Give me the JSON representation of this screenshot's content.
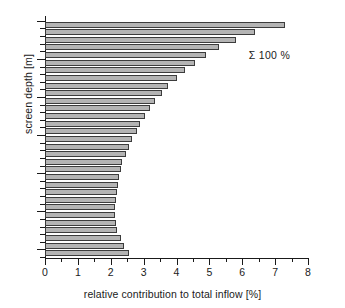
{
  "chart_data": {
    "type": "bar",
    "orientation": "horizontal",
    "title": "",
    "xlabel": "relative contribution to total inflow [%]",
    "ylabel": "screen depth [m]",
    "xlim": [
      0,
      8
    ],
    "ylim": [
      51,
      19.5
    ],
    "xticks": [
      0,
      1,
      2,
      3,
      4,
      5,
      6,
      7,
      8
    ],
    "xtick_labels": [
      "0",
      "1",
      "2",
      "3",
      "4",
      "5",
      "6",
      "7",
      "8"
    ],
    "x_minor_ticks": [
      0.5,
      1.5,
      2.5,
      3.5,
      4.5,
      5.5,
      6.5,
      7.5
    ],
    "yticks": [
      20,
      25,
      30,
      35,
      40,
      45,
      50
    ],
    "ytick_labels": [
      "20",
      "25",
      "30",
      "35",
      "40",
      "45",
      "50"
    ],
    "y_minor_step": 1,
    "grid": false,
    "legend": false,
    "annotations": [
      {
        "text": "Σ 100 %",
        "x": 6.2,
        "y": 24.6
      }
    ],
    "bar_color": "#b4b4b4",
    "bar_edge_color": "#3c3c3c",
    "categories": [
      20.5,
      21.5,
      22.5,
      23.5,
      24.5,
      25.5,
      26.5,
      27.5,
      28.5,
      29.5,
      30.5,
      31.5,
      32.5,
      33.5,
      34.5,
      35.5,
      36.5,
      37.5,
      38.5,
      39.5,
      40.5,
      41.5,
      42.5,
      43.5,
      44.5,
      45.5,
      46.5,
      47.5,
      48.5,
      49.5,
      50.5
    ],
    "values": [
      7.3,
      6.4,
      5.8,
      5.3,
      4.9,
      4.55,
      4.25,
      4.0,
      3.75,
      3.55,
      3.35,
      3.2,
      3.05,
      2.9,
      2.8,
      2.65,
      2.55,
      2.45,
      2.35,
      2.3,
      2.25,
      2.22,
      2.2,
      2.15,
      2.12,
      2.12,
      2.15,
      2.2,
      2.3,
      2.4,
      2.55
    ],
    "series_name": "relative contribution"
  }
}
